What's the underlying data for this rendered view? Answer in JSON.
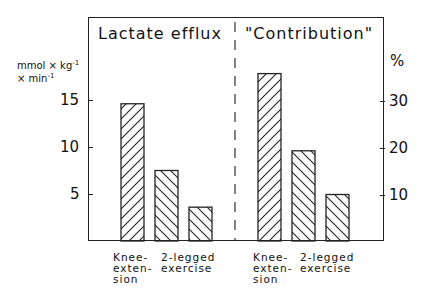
{
  "chart_data": [
    {
      "type": "bar",
      "title": "Lactate efflux",
      "ylabel": "mmol × kg⁻¹ × min⁻¹",
      "categories": [
        "Knee-extension",
        "2-legged exercise",
        ""
      ],
      "values": [
        14.6,
        7.5,
        3.6
      ],
      "hatch": [
        "forward",
        "backward",
        "backward"
      ],
      "yticks": [
        5,
        10,
        15
      ],
      "ylim": [
        0,
        19.9
      ],
      "axis_side": "left",
      "grid": false
    },
    {
      "type": "bar",
      "title": "\"Contribution\"",
      "ylabel": "%",
      "categories": [
        "Knee-extension",
        "2-legged exercise",
        ""
      ],
      "values": [
        36,
        19.4,
        10
      ],
      "hatch": [
        "forward",
        "backward",
        "backward"
      ],
      "yticks": [
        10,
        20,
        30
      ],
      "ylim": [
        0,
        40
      ],
      "axis_side": "right",
      "grid": false
    }
  ],
  "labels": {
    "left_title": "Lactate efflux",
    "right_title": "\"Contribution\"",
    "left_unit_line1": "mmol × kg",
    "left_unit_sup1": "-1",
    "left_unit_line2": "× min",
    "left_unit_sup2": "-1",
    "right_unit": "%",
    "left_ticks": [
      "15",
      "10",
      "5"
    ],
    "right_ticks": [
      "30",
      "20",
      "10"
    ],
    "left_cat_1": "Knee-\nexten-\nsion",
    "left_cat_2": "2-legged\nexercise",
    "right_cat_1": "Knee-\nexten-\nsion",
    "right_cat_2": "2-legged\nexercise"
  }
}
